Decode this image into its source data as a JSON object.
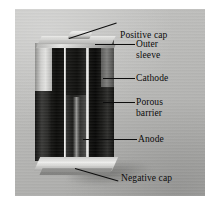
{
  "figure": {
    "type": "labelled-photograph",
    "background_color": "#ffffff",
    "photo": {
      "background_color": "#bdbdbb",
      "left": 15,
      "top": 9,
      "width": 190,
      "height": 187
    }
  },
  "labels": [
    {
      "id": "positive-cap",
      "text": "Positive cap",
      "line1": "Positive cap",
      "line2": ""
    },
    {
      "id": "outer-sleeve",
      "text": "Outer sleeve",
      "line1": "Outer",
      "line2": "sleeve"
    },
    {
      "id": "cathode",
      "text": "Cathode",
      "line1": "Cathode",
      "line2": ""
    },
    {
      "id": "porous-barrier",
      "text": "Porous barrier",
      "line1": "Porous",
      "line2": "barrier"
    },
    {
      "id": "anode",
      "text": "Anode",
      "line1": "Anode",
      "line2": ""
    },
    {
      "id": "negative-cap",
      "text": "Negative cap",
      "line1": "Negative cap",
      "line2": ""
    }
  ],
  "colors": {
    "text": "#0b0b0b",
    "leader_line": "#0d0d0d",
    "photo_background": "#bdbdbb",
    "cathode": "#0c0c0a",
    "anode": "#2b2b29",
    "barrier": "#e8e8e6",
    "sleeve_metal": "#d2d2d0",
    "sleeve_black": "#141412",
    "cap_metal": "#eaeae8"
  }
}
